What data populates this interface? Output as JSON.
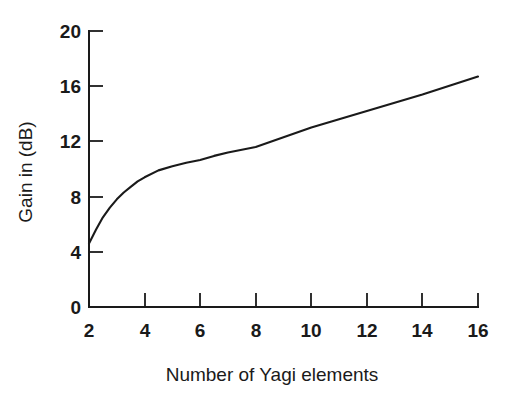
{
  "chart_data": {
    "type": "line",
    "title": "",
    "xlabel": "Number of Yagi elements",
    "ylabel": "Gain in (dB)",
    "xlim": [
      2,
      16
    ],
    "ylim": [
      0,
      20
    ],
    "xticks": [
      2,
      4,
      6,
      8,
      10,
      12,
      14,
      16
    ],
    "xtick_labels": [
      "2",
      "4",
      "6",
      "8",
      "10",
      "12",
      "14",
      "16"
    ],
    "yticks": [
      0,
      4,
      8,
      12,
      16,
      20
    ],
    "ytick_labels": [
      "0",
      "4",
      "8",
      "12",
      "16",
      "20"
    ],
    "grid": false,
    "legend": false,
    "legend_position": "none",
    "line_color": "#1a1a1a",
    "background_color": "#ffffff",
    "axes_style": "left-and-bottom-spines-only",
    "tick_direction": "in",
    "series": [
      {
        "name": "Yagi antenna gain",
        "x": [
          2,
          2.25,
          2.5,
          2.75,
          3,
          3.25,
          3.5,
          3.75,
          4,
          4.5,
          5,
          5.5,
          6,
          6.5,
          7,
          7.5,
          8,
          9,
          10,
          11,
          12,
          13,
          14,
          15,
          16
        ],
        "values": [
          4.6,
          5.6,
          6.5,
          7.2,
          7.8,
          8.3,
          8.7,
          9.1,
          9.4,
          9.9,
          10.2,
          10.45,
          10.65,
          10.95,
          11.2,
          11.4,
          11.6,
          12.3,
          13.0,
          13.6,
          14.2,
          14.8,
          15.4,
          16.05,
          16.7
        ]
      }
    ],
    "annotations": []
  },
  "figure": {
    "caption": ""
  }
}
